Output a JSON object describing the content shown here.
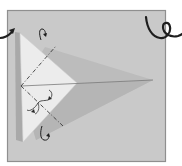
{
  "diagram": {
    "type": "origami-fold-step",
    "colors": {
      "page_background": "#ffffff",
      "frame_fill": "#c9c9c9",
      "frame_border": "#8f8f8f",
      "kite_fill": "#bdbdbd",
      "kite_shadow": "#b0b0b0",
      "front_flap_fill": "#ececec",
      "crease_line": "#7a7a7a",
      "fold_line": "#3a3a3a",
      "arrow": "#1e1e1e"
    },
    "elements": {
      "frame": "square-frame",
      "paper": "kite-shape",
      "front_flap": "triangular-flap",
      "fold_lines": [
        "upper-dash-dot-fold-line",
        "lower-dash-dot-fold-line"
      ],
      "arrows": [
        "incoming-step-arrow",
        "next-step-curl-arrow",
        "top-fold-arrow",
        "bottom-fold-arrow",
        "middle-fold-arrows"
      ]
    }
  }
}
